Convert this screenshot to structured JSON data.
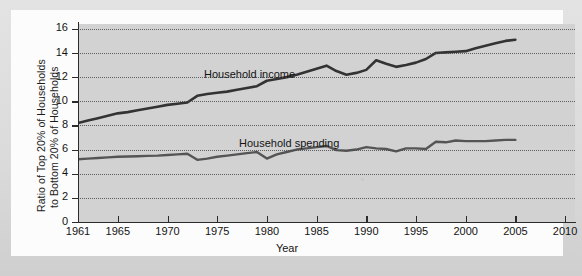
{
  "figure": {
    "background_color": "#fcfcfc",
    "page_color": "#dcdcdc",
    "plot_background_color": "#d2d2d2",
    "line_color_income": "#333333",
    "line_color_spending": "#555555",
    "gridline_color": "#4a4a4a"
  },
  "axis": {
    "y_title_line1": "Ratio of Top 20% of Households",
    "y_title_line2": "to Bottom 20% of Households",
    "x_title": "Year",
    "y_ticks": [
      "0",
      "2",
      "4",
      "6",
      "8",
      "10",
      "12",
      "14",
      "16"
    ],
    "x_ticks": [
      "1961",
      "1965",
      "1970",
      "1975",
      "1980",
      "1985",
      "1990",
      "1995",
      "2000",
      "2005",
      "2010"
    ]
  },
  "labels": {
    "income": "Household income",
    "spending": "Household spending"
  },
  "chart_data": {
    "type": "line",
    "title": "",
    "xlabel": "Year",
    "ylabel": "Ratio of Top 20% of Households to Bottom 20% of Households",
    "xlim": [
      1961,
      2011
    ],
    "ylim": [
      0,
      16.4
    ],
    "grid": "horizontal-dotted",
    "legend_position": "inline-annotations",
    "x_tick_values": [
      1961,
      1965,
      1970,
      1975,
      1980,
      1985,
      1990,
      1995,
      2000,
      2005,
      2010
    ],
    "y_tick_values": [
      0,
      2,
      4,
      6,
      8,
      10,
      12,
      14,
      16
    ],
    "x": [
      1961,
      1962,
      1963,
      1964,
      1965,
      1966,
      1967,
      1968,
      1969,
      1970,
      1971,
      1972,
      1973,
      1974,
      1975,
      1976,
      1977,
      1978,
      1979,
      1980,
      1981,
      1982,
      1983,
      1984,
      1985,
      1986,
      1987,
      1988,
      1989,
      1990,
      1991,
      1992,
      1993,
      1994,
      1995,
      1996,
      1997,
      1998,
      1999,
      2000,
      2001,
      2002,
      2003,
      2004,
      2005
    ],
    "series": [
      {
        "name": "Household income",
        "color": "#333333",
        "values": [
          8.2,
          8.4,
          8.6,
          8.8,
          9.0,
          9.1,
          9.25,
          9.4,
          9.55,
          9.7,
          9.8,
          9.9,
          10.45,
          10.6,
          10.7,
          10.8,
          10.95,
          11.1,
          11.25,
          11.7,
          11.85,
          12.0,
          12.2,
          12.45,
          12.7,
          12.95,
          12.5,
          12.2,
          12.35,
          12.6,
          13.4,
          13.1,
          12.85,
          13.0,
          13.2,
          13.5,
          14.0,
          14.05,
          14.1,
          14.15,
          14.4,
          14.6,
          14.8,
          15.0,
          15.1
        ]
      },
      {
        "name": "Household spending",
        "color": "#555555",
        "values": [
          5.2,
          5.25,
          5.3,
          5.35,
          5.4,
          5.42,
          5.45,
          5.48,
          5.5,
          5.55,
          5.6,
          5.65,
          5.15,
          5.25,
          5.4,
          5.5,
          5.6,
          5.7,
          5.8,
          5.25,
          5.6,
          5.8,
          6.0,
          6.1,
          6.2,
          6.3,
          5.95,
          5.9,
          6.0,
          6.2,
          6.1,
          6.05,
          5.85,
          6.1,
          6.1,
          6.05,
          6.65,
          6.6,
          6.75,
          6.7,
          6.7,
          6.7,
          6.75,
          6.8,
          6.8
        ]
      }
    ]
  }
}
